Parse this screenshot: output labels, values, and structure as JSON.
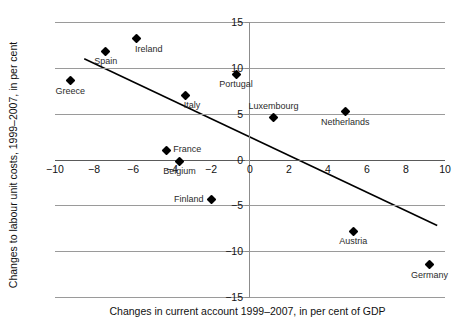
{
  "chart_data": {
    "type": "scatter",
    "title": "",
    "xlabel": "Changes in current account 1999–2007, in per cent of GDP",
    "ylabel": "Changes to labour unit costs, 1999–2007, in per cent",
    "xlim": [
      -10,
      10
    ],
    "ylim": [
      -15,
      15
    ],
    "xticks": [
      -10,
      -8,
      -6,
      -4,
      -2,
      0,
      2,
      4,
      6,
      8,
      10
    ],
    "xtick_labels": [
      "−10",
      "−8",
      "−6",
      "−4",
      "−2",
      "0",
      "2",
      "4",
      "6",
      "8",
      "10"
    ],
    "yticks": [
      -15,
      -10,
      -5,
      0,
      5,
      10,
      15
    ],
    "ytick_labels": [
      "−15",
      "−10",
      "−5",
      "0",
      "5",
      "10",
      "15"
    ],
    "grid": "horizontal",
    "legend": "none",
    "marker_shape": "diamond",
    "marker_color": "#000000",
    "points": [
      {
        "label": "Greece",
        "x": -9.2,
        "y": 8.6,
        "label_pos": "below"
      },
      {
        "label": "Spain",
        "x": -7.4,
        "y": 11.8,
        "label_pos": "below"
      },
      {
        "label": "Ireland",
        "x": -5.8,
        "y": 13.2,
        "label_pos": "below-right"
      },
      {
        "label": "Italy",
        "x": -3.3,
        "y": 7.0,
        "label_pos": "below-right"
      },
      {
        "label": "Portugal",
        "x": -0.7,
        "y": 9.3,
        "label_pos": "below"
      },
      {
        "label": "France",
        "x": -4.3,
        "y": 1.0,
        "label_pos": "right"
      },
      {
        "label": "Belgium",
        "x": -3.6,
        "y": -0.2,
        "label_pos": "below"
      },
      {
        "label": "Finland",
        "x": -2.0,
        "y": -4.4,
        "label_pos": "left"
      },
      {
        "label": "Luxembourg",
        "x": 1.2,
        "y": 4.6,
        "label_pos": "above"
      },
      {
        "label": "Netherlands",
        "x": 4.9,
        "y": 5.2,
        "label_pos": "below"
      },
      {
        "label": "Austria",
        "x": 5.3,
        "y": -7.8,
        "label_pos": "below"
      },
      {
        "label": "Germany",
        "x": 9.2,
        "y": -11.5,
        "label_pos": "below"
      }
    ],
    "trendline": {
      "x_start": -8.5,
      "y_start": 11.0,
      "x_end": 9.6,
      "y_end": -7.2,
      "color": "#000000"
    }
  }
}
